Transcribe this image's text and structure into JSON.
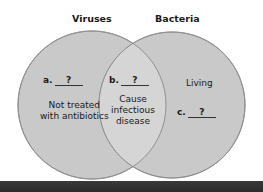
{
  "diagram": {
    "type": "venn",
    "sets": [
      {
        "id": "left",
        "title": "Viruses"
      },
      {
        "id": "right",
        "title": "Bacteria"
      }
    ],
    "regions": {
      "left_only": {
        "blank_letter": "a.",
        "blank_value": "?",
        "text": [
          "Not treated",
          "with antibiotics"
        ]
      },
      "overlap": {
        "blank_letter": "b.",
        "blank_value": "?",
        "text": [
          "Cause",
          "infectious",
          "disease"
        ]
      },
      "right_only": {
        "text": [
          "Living"
        ],
        "blank_letter": "c.",
        "blank_value": "?"
      }
    },
    "colors": {
      "circle_fill": "#c8c8c8",
      "overlap_fill": "#d6d6d6",
      "stroke": "#8a8a8a",
      "background": "#ffffff",
      "bottom_bar": "#333333"
    }
  }
}
